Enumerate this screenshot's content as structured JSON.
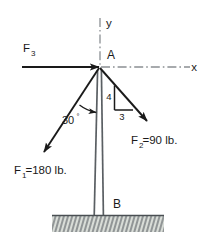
{
  "figure": {
    "type": "free-body-diagram",
    "colors": {
      "line": "#1a1a1a",
      "pole": "#5a5f63",
      "centerline": "#8a8f93",
      "ground_fill": "#d9ddd8",
      "ground_hatch": "#5a5f63",
      "background": "#ffffff"
    }
  },
  "axes": {
    "x_label": "x",
    "y_label": "y",
    "origin_label": "A",
    "style": "dash-dot centerline"
  },
  "points": [
    {
      "name": "A",
      "label": "A",
      "role": "top of pole, point of force application"
    },
    {
      "name": "B",
      "label": "B",
      "role": "base of pole at ground"
    }
  ],
  "forces": [
    {
      "name": "F1",
      "symbol": "F",
      "subscript": "1",
      "label": "F",
      "value_text": "=180 lb.",
      "magnitude": 180,
      "units": "lb.",
      "full_label": "F1=180 lb.",
      "direction": "down and to the left from A",
      "angle_from_pole_deg": 30
    },
    {
      "name": "F2",
      "symbol": "F",
      "subscript": "2",
      "label": "F",
      "value_text": "=90 lb.",
      "magnitude": 90,
      "units": "lb.",
      "full_label": "F2=90 lb.",
      "direction": "down and to the right from A",
      "slope_rise": "4",
      "slope_run": "3"
    },
    {
      "name": "F3",
      "symbol": "F",
      "subscript": "3",
      "label": "F",
      "value_text": "",
      "magnitude": null,
      "units": "",
      "full_label": "F3",
      "direction": "horizontal, pointing right toward A"
    }
  ],
  "annotations": {
    "angle_value": "30",
    "angle_degree_symbol": "°",
    "angle_full": "30°",
    "slope_triangle": {
      "vertical_leg_label": "4",
      "horizontal_leg_label": "3"
    }
  },
  "ground": {
    "label": "hatched fixed support"
  }
}
